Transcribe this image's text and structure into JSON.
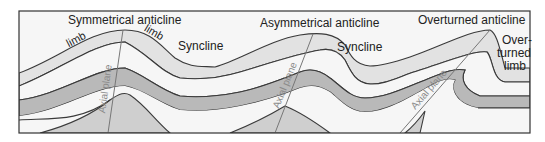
{
  "title_labels": {
    "symmetrical": "Symmetrical anticline",
    "asymmetrical": "Asymmetrical anticline",
    "overturned": "Overturned anticline"
  },
  "syncline_labels": [
    "Syncline",
    "Syncline"
  ],
  "limb_labels": [
    "limb",
    "limb"
  ],
  "overturned_limb": {
    "line1": "Over-",
    "line2": "turned",
    "line3": "limb"
  },
  "axial_plane_labels": [
    "Axial plane",
    "Axial plane",
    "Axial plane"
  ],
  "colors": {
    "frame": "#333333",
    "layer_light": "#e2e2e2",
    "layer_white": "#f6f6f6",
    "layer_dark": "#b9b9b9",
    "base_mid": "#cfcfcf",
    "outline": "#3a3a3a",
    "axial_line": "#777777"
  }
}
